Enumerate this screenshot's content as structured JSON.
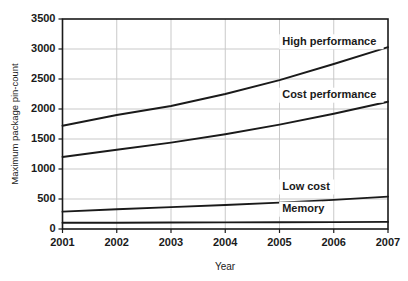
{
  "chart_data": {
    "type": "line",
    "title": "",
    "xlabel": "Year",
    "ylabel": "Maximum package pin-count",
    "x": [
      2001,
      2002,
      2003,
      2004,
      2005,
      2006,
      2007
    ],
    "categories": [
      "2001",
      "2002",
      "2003",
      "2004",
      "2005",
      "2006",
      "2007"
    ],
    "xlim": [
      2001,
      2007
    ],
    "ylim": [
      0,
      3500
    ],
    "ytick_labels": [
      "0",
      "500",
      "1000",
      "1500",
      "2000",
      "2500",
      "3000",
      "3500"
    ],
    "yticks": [
      0,
      500,
      1000,
      1500,
      2000,
      2500,
      3000,
      3500
    ],
    "grid": "horizontal-and-vertical",
    "legend_position": "inline-annotations",
    "series": [
      {
        "name": "High performance",
        "label": "High performance",
        "values": [
          1720,
          1900,
          2050,
          2250,
          2480,
          2750,
          3030
        ],
        "color": "#1a1a1a",
        "annotation_x": 2005.05,
        "annotation_y": 3120
      },
      {
        "name": "Cost performance",
        "label": "Cost performance",
        "values": [
          1200,
          1320,
          1440,
          1580,
          1740,
          1920,
          2120
        ],
        "color": "#1a1a1a",
        "annotation_x": 2005.05,
        "annotation_y": 2230
      },
      {
        "name": "Low cost",
        "label": "Low cost",
        "values": [
          290,
          330,
          365,
          400,
          440,
          485,
          540
        ],
        "color": "#1a1a1a",
        "annotation_x": 2005.05,
        "annotation_y": 700
      },
      {
        "name": "Memory",
        "label": "Memory",
        "values": [
          105,
          105,
          108,
          110,
          112,
          115,
          118
        ],
        "color": "#1a1a1a",
        "annotation_x": 2005.05,
        "annotation_y": 330
      }
    ]
  },
  "axis": {
    "x_title": "Year",
    "y_title": "Maximum package pin-count"
  }
}
